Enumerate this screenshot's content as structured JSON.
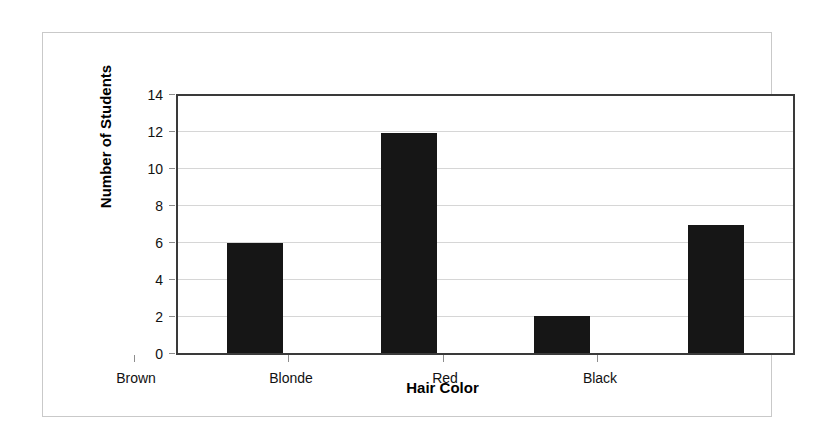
{
  "chart_data": {
    "type": "bar",
    "title": "",
    "categories": [
      "Brown",
      "Blonde",
      "Red",
      "Black"
    ],
    "values": [
      6,
      12,
      2,
      7
    ],
    "series": [
      {
        "name": "Number of Students",
        "values": [
          6,
          12,
          2,
          7
        ]
      }
    ],
    "xlabel": "Hair Color",
    "ylabel": "Number of Students",
    "ylim": [
      0,
      14
    ],
    "y_ticks": [
      0,
      2,
      4,
      6,
      8,
      10,
      12,
      14
    ],
    "y_tick_labels": [
      "0",
      "2",
      "4",
      "6",
      "8",
      "10",
      "12",
      "14"
    ],
    "grid": "horizontal",
    "legend": "none",
    "bar_color": "#161616",
    "gridline_color": "#d6d6d6",
    "plot_border_color": "#3a3a3a",
    "outer_frame_color": "#c9c9c9",
    "background_color": "#ffffff"
  }
}
